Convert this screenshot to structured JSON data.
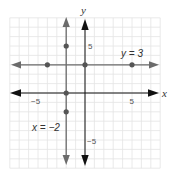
{
  "chart_data": {
    "type": "line",
    "title": "",
    "xlabel": "x",
    "ylabel": "y",
    "xlim": [
      -8,
      8
    ],
    "ylim": [
      -8,
      8
    ],
    "grid": true,
    "x_ticks_labeled": [
      -5,
      5
    ],
    "y_ticks_labeled": [
      5,
      -5
    ],
    "tick_labels": {
      "x_neg": "−5",
      "x_pos": "5",
      "y_pos": "5",
      "y_neg": "−5"
    },
    "series": [
      {
        "name": "y = 3",
        "kind": "horizontal-line",
        "equation": "y = 3",
        "value": 3,
        "points": [
          [
            -4,
            3
          ],
          [
            0,
            3
          ],
          [
            5,
            3
          ]
        ]
      },
      {
        "name": "x = -2",
        "kind": "vertical-line",
        "equation": "x = −2",
        "value": -2,
        "points": [
          [
            -2,
            5
          ],
          [
            -2,
            0
          ],
          [
            -2,
            -2
          ]
        ]
      }
    ],
    "annotations": [
      {
        "text": "y = 3",
        "x": 4,
        "y": 4.3
      },
      {
        "text": "x = −2",
        "x": -4.5,
        "y": -3.6
      }
    ]
  },
  "labels": {
    "x_axis": "x",
    "y_axis": "y",
    "line_h": "y = 3",
    "line_v": "x = −2",
    "tick_x_neg": "−5",
    "tick_x_pos": "5",
    "tick_y_pos": "5",
    "tick_y_neg": "−5"
  },
  "colors": {
    "axis": "#111111",
    "line": "#6b6b6b",
    "point": "#555555",
    "grid": "#e4e4e4"
  }
}
